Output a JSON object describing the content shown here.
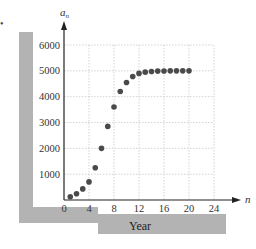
{
  "bullet": "•",
  "chart_data": {
    "type": "scatter",
    "title": "",
    "xlabel": "Year",
    "ylabel": "Insects per acre",
    "x_axis_symbol": "n",
    "y_axis_symbol": "a_n",
    "xlim": [
      0,
      24
    ],
    "ylim": [
      0,
      6000
    ],
    "xticks": [
      0,
      4,
      8,
      12,
      16,
      20,
      24
    ],
    "yticks": [
      1000,
      2000,
      3000,
      4000,
      5000,
      6000
    ],
    "grid": true,
    "legend": "none",
    "x": [
      1,
      2,
      3,
      4,
      5,
      6,
      7,
      8,
      9,
      10,
      11,
      12,
      13,
      14,
      15,
      16,
      17,
      18,
      19,
      20
    ],
    "values": [
      125,
      240,
      430,
      700,
      1250,
      2000,
      2850,
      3600,
      4200,
      4550,
      4780,
      4900,
      4950,
      4975,
      4990,
      4995,
      5000,
      5000,
      5000,
      5000
    ],
    "colors": {
      "points": "#4a4a4a",
      "grid": "#c8c8c8",
      "axis": "#222222",
      "band": "#b3b3b3"
    }
  },
  "labels": {
    "y_axis_title": "Insects per acre",
    "x_axis_title": "Year",
    "y_symbol": "a",
    "y_symbol_sub": "n",
    "x_symbol": "n"
  }
}
